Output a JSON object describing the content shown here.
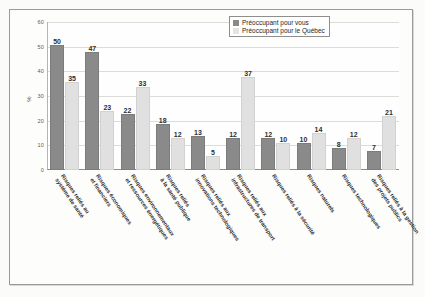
{
  "chart_data": {
    "type": "bar",
    "title": "",
    "xlabel": "",
    "ylabel": "%",
    "ylim": [
      0,
      60
    ],
    "yticks": [
      0,
      10,
      20,
      30,
      40,
      50,
      60
    ],
    "grid": true,
    "legend_position": "top-right",
    "categories": [
      "Risques reliés au\nsystème de santé",
      "Risques économiques\net financiers",
      "Risques environnementaux\net ressources énergétiques",
      "Risques reliés\nà la santé publique",
      "Risques reliés aux\ninnovations technologiques",
      "Risques reliés aux\ninfrastructures de transport",
      "Risques reliés à la sécurité",
      "Risques naturels",
      "Risques technologiques",
      "Risques reliés à la gestion\ndes projets publics"
    ],
    "series": [
      {
        "name": "Préoccupant pour vous",
        "color": "#8a8a8a",
        "values": [
          50,
          47,
          22,
          18,
          13,
          12,
          12,
          10,
          8,
          7
        ]
      },
      {
        "name": "Préoccupant pour le Québec",
        "color": "#e0e0e0",
        "values": [
          35,
          23,
          33,
          12,
          5,
          37,
          10,
          14,
          12,
          21
        ]
      }
    ]
  }
}
